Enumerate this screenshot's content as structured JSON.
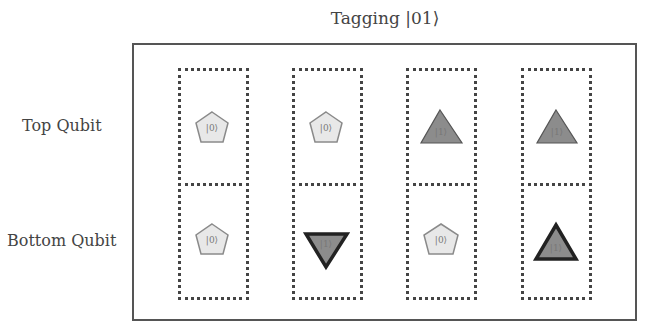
{
  "title": "Tagging |01⟩",
  "row_labels": {
    "top": "Top Qubit",
    "bottom": "Bottom Qubit"
  },
  "colors": {
    "pentagon_fill": "#e8e8e8",
    "pentagon_stroke": "#8a8a8a",
    "triangle_fill": "#8c8c8c",
    "triangle_stroke_thin": "#555555",
    "triangle_stroke_tagged": "#222222",
    "frame": "#555555",
    "dotted": "#444444"
  },
  "columns": [
    {
      "top": {
        "shape": "pentagon",
        "ket": "|0⟩",
        "tagged": false
      },
      "bottom": {
        "shape": "pentagon",
        "ket": "|0⟩",
        "tagged": false
      }
    },
    {
      "top": {
        "shape": "pentagon",
        "ket": "|0⟩",
        "tagged": false
      },
      "bottom": {
        "shape": "triangle-down",
        "ket": "|1⟩",
        "tagged": true
      }
    },
    {
      "top": {
        "shape": "triangle-up",
        "ket": "|1⟩",
        "tagged": false
      },
      "bottom": {
        "shape": "pentagon",
        "ket": "|0⟩",
        "tagged": false
      }
    },
    {
      "top": {
        "shape": "triangle-up",
        "ket": "|1⟩",
        "tagged": false
      },
      "bottom": {
        "shape": "triangle-up",
        "ket": "|1⟩",
        "tagged": true
      }
    }
  ]
}
